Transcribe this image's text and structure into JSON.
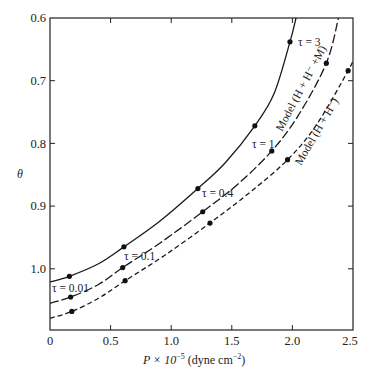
{
  "chart_data": {
    "type": "line",
    "title": "",
    "xlabel": "P × 10⁻⁵ (dyne cm⁻²)",
    "ylabel": "θ",
    "xlim": [
      0,
      2.5
    ],
    "ylim": [
      1.097,
      0.6
    ],
    "y_inverted": true,
    "grid": false,
    "x_ticks": [
      "0",
      "0.5",
      "1.0",
      "1.5",
      "2.0",
      "2.5"
    ],
    "y_ticks": [
      "0.6",
      "0.7",
      "0.8",
      "0.9",
      "1.0"
    ],
    "series": [
      {
        "name": "Model (H + H⁻ + M) upper (solid)",
        "style": "solid",
        "curve": [
          [
            0,
            1.021
          ],
          [
            0.16,
            1.012
          ],
          [
            0.4,
            0.992
          ],
          [
            0.61,
            0.965
          ],
          [
            0.9,
            0.925
          ],
          [
            1.22,
            0.872
          ],
          [
            1.45,
            0.83
          ],
          [
            1.69,
            0.772
          ],
          [
            1.85,
            0.72
          ],
          [
            1.98,
            0.638
          ],
          [
            2.03,
            0.6
          ]
        ],
        "points": [
          [
            0.16,
            1.012
          ],
          [
            0.61,
            0.965
          ],
          [
            1.22,
            0.872
          ],
          [
            1.69,
            0.772
          ],
          [
            1.98,
            0.638
          ]
        ]
      },
      {
        "name": "Model (H + H⁻ + M)",
        "style": "long-dash",
        "curve": [
          [
            0,
            1.055
          ],
          [
            0.17,
            1.045
          ],
          [
            0.4,
            1.025
          ],
          [
            0.6,
            0.998
          ],
          [
            0.9,
            0.96
          ],
          [
            1.26,
            0.909
          ],
          [
            1.55,
            0.865
          ],
          [
            1.83,
            0.812
          ],
          [
            2.05,
            0.755
          ],
          [
            2.28,
            0.672
          ],
          [
            2.38,
            0.6
          ]
        ],
        "points": [
          [
            0.17,
            1.045
          ],
          [
            0.6,
            0.998
          ],
          [
            1.26,
            0.909
          ],
          [
            1.83,
            0.812
          ],
          [
            2.28,
            0.672
          ]
        ]
      },
      {
        "name": "Model (H + H⁻)",
        "style": "short-dash",
        "curve": [
          [
            0,
            1.079
          ],
          [
            0.18,
            1.068
          ],
          [
            0.4,
            1.047
          ],
          [
            0.62,
            1.019
          ],
          [
            0.95,
            0.978
          ],
          [
            1.32,
            0.927
          ],
          [
            1.65,
            0.878
          ],
          [
            1.96,
            0.826
          ],
          [
            2.2,
            0.77
          ],
          [
            2.46,
            0.684
          ],
          [
            2.5,
            0.667
          ]
        ],
        "points": [
          [
            0.18,
            1.068
          ],
          [
            0.62,
            1.019
          ],
          [
            1.32,
            0.927
          ],
          [
            1.96,
            0.826
          ],
          [
            2.46,
            0.684
          ]
        ]
      }
    ],
    "annotations": [
      {
        "text": "τ = 3",
        "x": 2.02,
        "y": 0.638
      },
      {
        "text": "τ = 1",
        "x": 1.68,
        "y": 0.79
      },
      {
        "text": "τ = 0.4",
        "x": 1.25,
        "y": 0.89
      },
      {
        "text": "τ = 0.1",
        "x": 0.62,
        "y": 0.985
      },
      {
        "text": "τ = 0.01",
        "x": 0.02,
        "y": 1.033
      },
      {
        "text": "Model (H + H⁻ +M)",
        "rotated": true
      },
      {
        "text": "Model (H + H⁻)",
        "rotated": true
      }
    ]
  },
  "labels": {
    "ylabel": "θ",
    "xlabel_main": "P × 10",
    "xlabel_exp": "−5",
    "xlabel_unit": " (dyne  cm",
    "xlabel_unit_exp": "−2",
    "xlabel_close": ")",
    "x_ticks": [
      "0",
      "0.5",
      "1.0",
      "1.5",
      "2.0",
      "2.5"
    ],
    "y_ticks": [
      "0.6",
      "0.7",
      "0.8",
      "0.9",
      "1.0"
    ],
    "tau3": "τ = 3",
    "tau1": "τ = 1",
    "tau04": "τ = 0.4",
    "tau01": "τ = 0.1",
    "tau001": "τ = 0.01",
    "model_hm": "Model (H + H⁻ +M)",
    "model_h": "Model (H + H⁻)"
  }
}
